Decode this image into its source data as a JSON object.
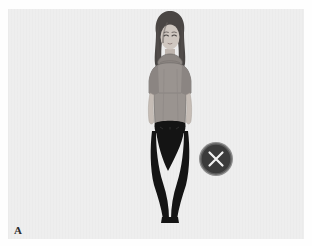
{
  "figure": {
    "panel_label": "A",
    "background_color": "#eeeeee",
    "outer_background_color": "#ffffff"
  },
  "avatar": {
    "name": "female-avatar",
    "description": "standing female figure",
    "hair_color": "#4a4644",
    "hair_highlight_color": "#6b6663",
    "skin_color": "#cfc7c0",
    "skin_shadow_color": "#b6ada6",
    "top_color": "#9a9490",
    "top_shadow_color": "#868080",
    "collar_color": "#8d8783",
    "pants_color": "#141414",
    "outline_color": "#3a3736"
  },
  "close_button": {
    "label": "close",
    "icon": "x-icon",
    "fill_color": "#3b3b3b",
    "rim_color": "#787878",
    "glyph_color": "#f2f2f2"
  }
}
